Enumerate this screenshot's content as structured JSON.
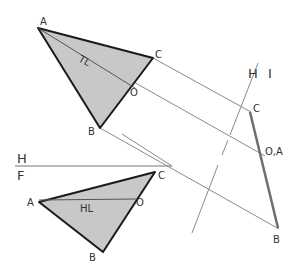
{
  "diagram": {
    "colors": {
      "fill": "#c8c8c8",
      "edge": "#1a1a1a",
      "projector": "#8a8a8a",
      "edge_view": "#6e6e6e",
      "text": "#333333"
    },
    "top_view": {
      "labels": {
        "A": "A",
        "B": "B",
        "C": "C",
        "O": "O"
      },
      "true_length_label": "TL"
    },
    "front_view": {
      "labels": {
        "A": "A",
        "B": "B",
        "C": "C",
        "O": "O"
      },
      "horizontal_line_label": "HL"
    },
    "fold_line_hf": {
      "upper": "H",
      "lower": "F"
    },
    "fold_line_hi": {
      "left": "H",
      "right": "I"
    },
    "aux_view": {
      "labels": {
        "C": "C",
        "OA": "O,A",
        "B": "B"
      }
    }
  }
}
